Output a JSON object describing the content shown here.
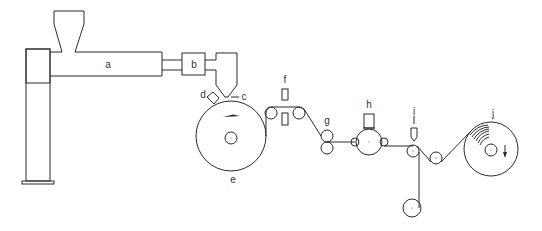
{
  "diagram": {
    "type": "process-schematic",
    "labels": {
      "a": "a",
      "b": "b",
      "c": "c",
      "d": "d",
      "e": "e",
      "f": "f",
      "g": "g",
      "h": "h",
      "i": "i",
      "j": "j"
    },
    "components": [
      {
        "id": "a",
        "label": "a",
        "shape": "extruder-barrel-with-hopper"
      },
      {
        "id": "b",
        "label": "b",
        "shape": "box"
      },
      {
        "id": "c",
        "label": "c",
        "shape": "die"
      },
      {
        "id": "d",
        "label": "d",
        "shape": "air-knife"
      },
      {
        "id": "e",
        "label": "e",
        "shape": "large-roll"
      },
      {
        "id": "f",
        "label": "f",
        "shape": "paired-rectangles"
      },
      {
        "id": "g",
        "label": "g",
        "shape": "nip-roll-pair"
      },
      {
        "id": "h",
        "label": "h",
        "shape": "roll-with-box"
      },
      {
        "id": "i",
        "label": "i",
        "shape": "knife"
      },
      {
        "id": "j",
        "label": "j",
        "shape": "winder-roll"
      }
    ],
    "stroke_color": "#2b2b2b",
    "background": "#ffffff"
  }
}
